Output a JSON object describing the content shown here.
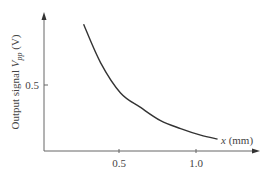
{
  "chart_data": {
    "type": "line",
    "title": "",
    "xlabel": "x (mm)",
    "ylabel": "Output signal V_pp (V)",
    "xlabel_parts": {
      "var": "x",
      "unit": " (mm)"
    },
    "ylabel_parts": {
      "prefix": "Output signal ",
      "var": "V",
      "sub": "pp",
      "unit": " (V)"
    },
    "x_ticks": [
      "0.5",
      "1.0"
    ],
    "y_ticks": [
      "0.5"
    ],
    "xlim": [
      0,
      1.4
    ],
    "ylim": [
      0,
      1.05
    ],
    "grid": false,
    "legend": null,
    "series": [
      {
        "name": "Vpp",
        "x": [
          0.27,
          0.38,
          0.51,
          0.64,
          0.77,
          0.9,
          1.03,
          1.14
        ],
        "y": [
          0.96,
          0.67,
          0.44,
          0.33,
          0.23,
          0.17,
          0.12,
          0.09
        ]
      }
    ],
    "line_color": "#333333"
  }
}
